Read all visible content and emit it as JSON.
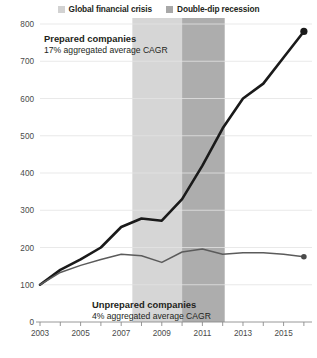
{
  "legend": {
    "items": [
      {
        "label": "Global financial crisis",
        "color": "#d2d2d2",
        "icon": "square-swatch-icon"
      },
      {
        "label": "Double-dip recession",
        "color": "#a8a8a8",
        "icon": "square-swatch-icon"
      }
    ]
  },
  "annotations": {
    "prepared": {
      "title": "Prepared companies",
      "subtitle": "17% aggregated average CAGR"
    },
    "unprepared": {
      "title": "Unprepared companies",
      "subtitle": "4% aggregated average CAGR"
    }
  },
  "axis": {
    "y_ticks": [
      "0",
      "100",
      "200",
      "300",
      "400",
      "500",
      "600",
      "700",
      "800"
    ],
    "x_ticks": [
      "2003",
      "2005",
      "2007",
      "2009",
      "2011",
      "2013",
      "2015"
    ]
  },
  "chart_data": {
    "type": "line",
    "title": "",
    "subtitle": "",
    "xlabel": "",
    "ylabel": "",
    "xlim": [
      2003,
      2016.4
    ],
    "ylim": [
      0,
      800
    ],
    "grid": true,
    "legend_position": "top-center",
    "x": [
      2003,
      2004,
      2005,
      2006,
      2007,
      2008,
      2009,
      2010,
      2011,
      2012,
      2013,
      2014,
      2015,
      2016
    ],
    "series": [
      {
        "name": "Prepared companies",
        "color": "#1a1a1a",
        "cagr_label": "17% aggregated average CAGR",
        "values": [
          100,
          140,
          168,
          200,
          255,
          278,
          272,
          330,
          420,
          520,
          600,
          640,
          710,
          780
        ],
        "endpoint_marker": true
      },
      {
        "name": "Unprepared companies",
        "color": "#5b5b5b",
        "cagr_label": "4% aggregated average CAGR",
        "values": [
          100,
          133,
          152,
          168,
          182,
          178,
          160,
          188,
          196,
          182,
          186,
          186,
          182,
          175
        ],
        "endpoint_marker": true
      }
    ],
    "shaded_bands": [
      {
        "name": "Global financial crisis",
        "x_start": 2007.55,
        "x_end": 2010.0,
        "color": "#d6d6d6"
      },
      {
        "name": "Double-dip recession",
        "x_start": 2010.0,
        "x_end": 2012.1,
        "color": "#adadad"
      }
    ]
  }
}
